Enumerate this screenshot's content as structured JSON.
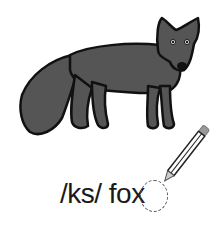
{
  "illustration": {
    "subject": "fox",
    "fill_color": "#555555",
    "outline_color": "#111111"
  },
  "caption": {
    "phoneme": "/ks/",
    "word": "fox",
    "full_text": "/ks/ fox"
  },
  "highlight": {
    "letter": "x",
    "style": "dashed-circle"
  },
  "icons": {
    "pencil": "pencil-icon"
  }
}
